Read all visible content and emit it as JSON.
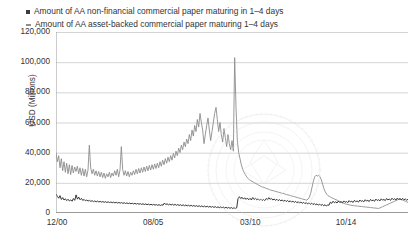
{
  "chart_data": {
    "type": "line",
    "title": "",
    "xlabel": "",
    "ylabel": "USD (Millions)",
    "ylim": [
      0,
      120000
    ],
    "ytick_labels": [
      "120,000",
      "100,000",
      "80,000",
      "60,000",
      "40,000",
      "20,000",
      "0"
    ],
    "ytick_values": [
      120000,
      100000,
      80000,
      60000,
      40000,
      20000,
      0
    ],
    "xtick_labels": [
      "12/00",
      "08/05",
      "03/10",
      "10/14"
    ],
    "xtick_positions": [
      0.003,
      0.276,
      0.552,
      0.824
    ],
    "grid": true,
    "legend_position": "above-plot",
    "series": [
      {
        "name": "Amount of AA non-financial commercial paper maturing in 1–4 days",
        "color": "#1f1f1f",
        "marker": "square",
        "values": [
          12600,
          11000,
          9800,
          11500,
          9000,
          10200,
          8600,
          9400,
          8200,
          9100,
          8000,
          8700,
          7800,
          9600,
          8400,
          12000,
          9200,
          10500,
          8800,
          9700,
          8300,
          9000,
          8100,
          8600,
          7900,
          8400,
          7700,
          8200,
          7500,
          8000,
          7400,
          7900,
          7300,
          7700,
          7200,
          7600,
          7100,
          7500,
          7000,
          7400,
          6900,
          7300,
          6800,
          7200,
          6700,
          7100,
          6600,
          7000,
          6500,
          6900,
          6400,
          6800,
          6300,
          6700,
          6200,
          6600,
          6100,
          6500,
          6000,
          6400,
          5900,
          6300,
          5800,
          6200,
          5700,
          6100,
          5600,
          6000,
          5500,
          5900,
          5400,
          5800,
          5300,
          5700,
          5200,
          5600,
          5100,
          5500,
          5000,
          5400,
          5200,
          6600,
          5600,
          6100,
          5400,
          5900,
          5300,
          5800,
          5200,
          5700,
          5100,
          5600,
          5000,
          5500,
          4900,
          5400,
          4800,
          5300,
          4700,
          5200,
          4600,
          5100,
          4500,
          5000,
          4400,
          4900,
          4300,
          4800,
          4200,
          4700,
          4100,
          4600,
          4000,
          4500,
          3900,
          4400,
          3800,
          4300,
          3700,
          4200,
          3600,
          4100,
          3500,
          4000,
          3400,
          3900,
          3300,
          3800,
          3200,
          3700,
          3100,
          3600,
          3000,
          3500,
          3000,
          3400,
          9500,
          10800,
          9600,
          10400,
          9200,
          10100,
          9000,
          9900,
          8800,
          9700,
          8600,
          10300,
          9000,
          9800,
          8700,
          9400,
          8500,
          9200,
          8300,
          9000,
          8200,
          9600,
          8800,
          10200,
          9000,
          9700,
          8600,
          9300,
          8400,
          9100,
          8200,
          8900,
          8000,
          8700,
          7800,
          8500,
          7600,
          8300,
          7400,
          8100,
          7200,
          7900,
          7000,
          7700,
          6800,
          7500,
          6600,
          7300,
          6400,
          7100,
          6200,
          6900,
          6000,
          6700,
          5800,
          6500,
          5600,
          6300,
          5400,
          6100,
          5200,
          5900,
          5000,
          5700,
          4800,
          5500,
          4600,
          5300,
          5200,
          7200,
          6400,
          7800,
          6800,
          7400,
          6600,
          7900,
          7000,
          7500,
          6700,
          8000,
          7100,
          7600,
          6900,
          8200,
          7300,
          7800,
          7000,
          8400,
          7500,
          8000,
          7200,
          8600,
          7700,
          8200,
          7400,
          8800,
          7900,
          8400,
          7600,
          9000,
          8100,
          8600,
          7800,
          9200,
          8300,
          8800,
          8000,
          9400,
          8500,
          9000,
          8200,
          9600,
          8700,
          9200,
          8400,
          9800,
          8900,
          9400,
          8600,
          9900,
          9000,
          9500,
          8700,
          9700,
          8800,
          9300,
          8500,
          9100
        ]
      },
      {
        "name": "Amount of AA asset-backed commercial paper maturing 1–4 days",
        "color": "#8c8c8c",
        "marker": "dash",
        "values": [
          40000,
          34000,
          38000,
          30000,
          36000,
          28000,
          34000,
          27000,
          33000,
          26000,
          32000,
          25500,
          31500,
          26500,
          30500,
          27500,
          31000,
          26000,
          30000,
          25000,
          29500,
          24500,
          29000,
          24000,
          28500,
          45000,
          30000,
          26000,
          29000,
          25000,
          28000,
          24500,
          27500,
          24000,
          27000,
          23500,
          26500,
          23000,
          26000,
          24000,
          27000,
          23500,
          26500,
          24500,
          28000,
          25000,
          29000,
          24000,
          28500,
          44000,
          29000,
          25000,
          28000,
          24500,
          27500,
          24000,
          27000,
          25000,
          28000,
          25500,
          29000,
          26000,
          29500,
          26500,
          30000,
          27000,
          30500,
          27500,
          31000,
          28000,
          31500,
          28500,
          32000,
          29000,
          32500,
          29500,
          33000,
          30000,
          34000,
          31000,
          35000,
          32000,
          36000,
          33000,
          37000,
          34000,
          38000,
          35000,
          39500,
          36500,
          41000,
          38000,
          43000,
          40000,
          45000,
          42000,
          47000,
          44000,
          49000,
          46000,
          52000,
          48000,
          55000,
          51000,
          58000,
          54000,
          62000,
          57000,
          66000,
          60000,
          55000,
          46000,
          52000,
          58000,
          63000,
          55000,
          48000,
          54000,
          60000,
          66000,
          70000,
          62000,
          54000,
          60000,
          52000,
          47000,
          56000,
          50000,
          44000,
          52000,
          46000,
          42000,
          48000,
          41000,
          103000,
          70000,
          48000,
          40000,
          36000,
          32000,
          29000,
          27000,
          25500,
          24000,
          23000,
          22000,
          21500,
          21000,
          20500,
          20000,
          19500,
          19000,
          18500,
          18000,
          17500,
          17200,
          17000,
          16500,
          16200,
          16000,
          15500,
          15200,
          15000,
          14800,
          14500,
          14200,
          14000,
          13800,
          13500,
          13200,
          13000,
          12800,
          12500,
          12200,
          12000,
          11800,
          11500,
          11200,
          11000,
          10800,
          10500,
          10200,
          10000,
          9800,
          9500,
          9200,
          9000,
          8800,
          8500,
          9200,
          10500,
          13000,
          17000,
          21000,
          24000,
          25000,
          24500,
          25000,
          24000,
          22000,
          19000,
          16000,
          14000,
          12500,
          11500,
          11000,
          10500,
          10000,
          9600,
          9200,
          8800,
          8400,
          8000,
          7600,
          7200,
          6800,
          6400,
          6000,
          5800,
          5600,
          5400,
          5200,
          5000,
          4900,
          4800,
          4700,
          4600,
          4500,
          4400,
          4300,
          4200,
          4100,
          4000,
          3900,
          3800,
          3700,
          3600,
          3500,
          3400,
          3300,
          3200,
          3100,
          3000,
          3400,
          3800,
          4200,
          4600,
          5000,
          5400,
          5800,
          6200,
          6600,
          7000,
          7400,
          7800,
          8200,
          8600,
          9000,
          9400,
          9000,
          8600,
          8200,
          7800,
          7400,
          7000
        ]
      }
    ]
  }
}
